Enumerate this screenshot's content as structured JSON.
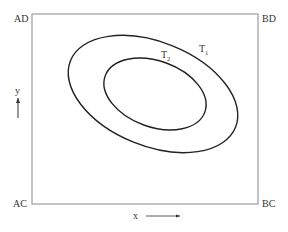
{
  "diagram": {
    "corners": {
      "top_left": "AD",
      "top_right": "BD",
      "bottom_left": "AC",
      "bottom_right": "BC"
    },
    "axes": {
      "x_label": "x",
      "y_label": "y"
    },
    "contours": [
      {
        "name": "T",
        "subscript": "1",
        "level": "outer"
      },
      {
        "name": "T",
        "subscript": "2",
        "level": "inner"
      }
    ],
    "colors": {
      "frame": "#8a8a8a",
      "curve": "#222222",
      "text": "#333333"
    }
  }
}
